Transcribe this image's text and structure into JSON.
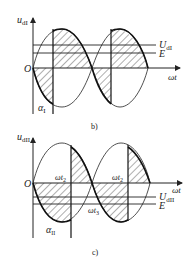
{
  "figure_b": {
    "y_axis_label": "u",
    "y_axis_sub": "dI",
    "origin_label": "O",
    "x_axis_label": "ωt",
    "level_1_label": "U",
    "level_1_sub": "dI",
    "level_2_label": "E",
    "angle_label": "α",
    "angle_sub": "I",
    "caption": "b)"
  },
  "figure_c": {
    "y_axis_label": "u",
    "y_axis_sub": "dII",
    "origin_label": "O",
    "x_axis_label": "ωt",
    "level_1_label": "U",
    "level_1_sub": "dII",
    "level_2_label": "E",
    "t2_label_a": "ωt",
    "t2_sub_a": "2",
    "t2_label_b": "ωt",
    "t2_sub_b": "2",
    "t3_label": "ωt",
    "t3_sub": "3",
    "angle_label": "α",
    "angle_sub": "II",
    "caption": "c)"
  },
  "colors": {
    "line": "#222222",
    "hatch": "#333333",
    "background": "#ffffff"
  }
}
